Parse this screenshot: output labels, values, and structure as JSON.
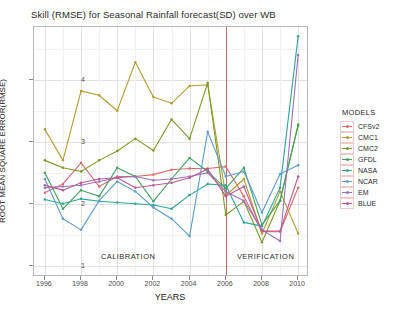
{
  "chart_data": {
    "type": "line",
    "title": "Skill (RMSE) for Seasonal Rainfall forecast(SD) over WB",
    "xlabel": "YEARS",
    "ylabel": "ROOT MEAN SQUARE ERROR(RMSE)",
    "xlim": [
      1995.4,
      2010.6
    ],
    "ylim": [
      0.82,
      4.85
    ],
    "xticks": [
      1996,
      1998,
      2000,
      2002,
      2004,
      2006,
      2008,
      2010
    ],
    "yticks": [
      1,
      2,
      3,
      4
    ],
    "grid": true,
    "legend_position": "right",
    "legend_title": "MODELS",
    "x": [
      1996,
      1997,
      1998,
      1999,
      2000,
      2001,
      2002,
      2003,
      2004,
      2005,
      2006,
      2007,
      2008,
      2009,
      2010
    ],
    "annotations": [
      {
        "text": "CALIBRATION",
        "x": 2000.6,
        "y": 1.14
      },
      {
        "text": "VERIFICATION",
        "x": 2008.2,
        "y": 1.14
      }
    ],
    "vertical_line": {
      "x": 2006,
      "color": "#d06a6a"
    },
    "series": [
      {
        "name": "CFSv2",
        "color": "#e06b6b",
        "values": [
          2.18,
          2.32,
          2.66,
          2.28,
          2.44,
          2.44,
          2.47,
          2.55,
          2.57,
          2.57,
          2.6,
          2.12,
          1.55,
          1.55,
          2.26
        ]
      },
      {
        "name": "CMC1",
        "color": "#b59c2e",
        "values": [
          3.2,
          2.7,
          3.82,
          3.75,
          3.5,
          4.28,
          3.72,
          3.62,
          3.9,
          3.92,
          2.13,
          2.4,
          1.52,
          2.2,
          1.52
        ]
      },
      {
        "name": "CMC2",
        "color": "#7a9a26",
        "values": [
          2.7,
          2.58,
          2.52,
          2.7,
          2.85,
          3.05,
          2.86,
          3.36,
          3.05,
          3.95,
          1.82,
          2.04,
          1.38,
          2.05,
          3.28
        ]
      },
      {
        "name": "GFDL",
        "color": "#3da35a",
        "values": [
          2.5,
          1.92,
          2.22,
          2.12,
          2.58,
          2.44,
          2.04,
          2.4,
          2.74,
          2.52,
          2.25,
          2.58,
          1.66,
          2.05,
          3.26
        ]
      },
      {
        "name": "NASA",
        "color": "#2aa79b",
        "values": [
          2.07,
          2.0,
          2.08,
          2.04,
          2.02,
          2.0,
          1.98,
          1.92,
          2.14,
          2.32,
          2.3,
          1.7,
          1.64,
          2.26,
          4.7
        ]
      },
      {
        "name": "NCAR",
        "color": "#5b9bd5",
        "values": [
          2.4,
          1.76,
          1.58,
          2.05,
          2.36,
          2.2,
          1.94,
          1.76,
          1.48,
          3.16,
          2.44,
          2.52,
          1.86,
          2.48,
          2.62
        ]
      },
      {
        "name": "EM",
        "color": "#9b6fc2",
        "values": [
          2.26,
          2.28,
          2.3,
          2.36,
          2.42,
          2.44,
          2.38,
          2.4,
          2.44,
          2.5,
          2.2,
          2.05,
          1.58,
          1.4,
          4.4
        ]
      },
      {
        "name": "BLUE",
        "color": "#c0588f",
        "values": [
          2.3,
          2.22,
          2.34,
          2.4,
          2.42,
          2.26,
          2.3,
          2.34,
          2.42,
          2.56,
          2.12,
          2.28,
          1.56,
          1.56,
          2.44
        ]
      }
    ]
  }
}
